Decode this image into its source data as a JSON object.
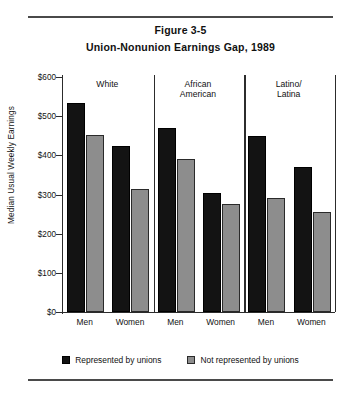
{
  "figure": {
    "label": "Figure 3-5",
    "title": "Union-Nonunion Earnings Gap, 1989"
  },
  "legend": {
    "items": [
      {
        "label": "Represented by unions",
        "color": "#131313"
      },
      {
        "label": "Not represented by unions",
        "color": "#8d8d8d"
      }
    ]
  },
  "chart_data": {
    "type": "bar",
    "title": "Union-Nonunion Earnings Gap, 1989",
    "xlabel": "",
    "ylabel": "Median Usual Weekly Earnings",
    "ylim": [
      0,
      600
    ],
    "ytick_labels": [
      "$600",
      "$500",
      "$400",
      "$300",
      "$200",
      "$100",
      "$0"
    ],
    "ytick_values": [
      600,
      500,
      400,
      300,
      200,
      100,
      0
    ],
    "grid": false,
    "legend_position": "bottom",
    "group_labels": [
      "White",
      "African American",
      "Latino/ Latina"
    ],
    "groups": [
      {
        "name": "White",
        "line1": "White",
        "line2": ""
      },
      {
        "name": "African American",
        "line1": "African",
        "line2": "American"
      },
      {
        "name": "Latino/Latina",
        "line1": "Latino/",
        "line2": "Latina"
      }
    ],
    "categories": [
      "Men",
      "Women",
      "Men",
      "Women",
      "Men",
      "Women"
    ],
    "series": [
      {
        "name": "Represented by unions",
        "color": "#131313",
        "values": [
          535,
          425,
          470,
          305,
          450,
          370
        ]
      },
      {
        "name": "Not represented by unions",
        "color": "#8d8d8d",
        "values": [
          452,
          315,
          390,
          275,
          290,
          255
        ]
      }
    ]
  }
}
